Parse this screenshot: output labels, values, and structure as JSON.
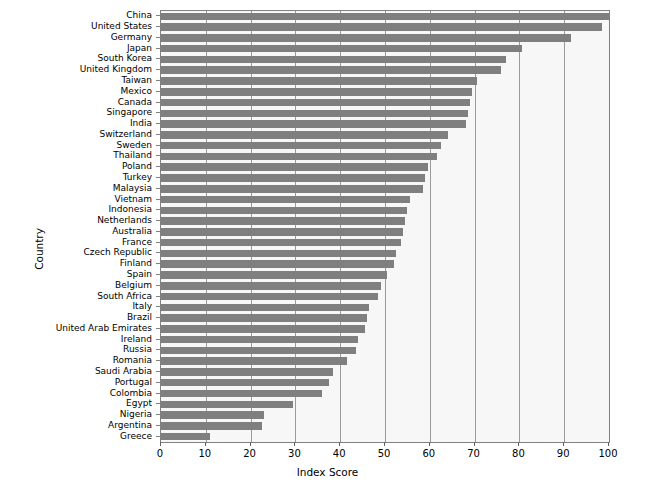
{
  "chart_data": {
    "type": "bar",
    "orientation": "horizontal",
    "title": "",
    "xlabel": "Index Score",
    "ylabel": "Country",
    "xlim": [
      0,
      100
    ],
    "xticks": [
      0,
      10,
      20,
      30,
      40,
      50,
      60,
      70,
      80,
      90,
      100
    ],
    "grid": true,
    "grid_axis": "x",
    "legend": false,
    "bar_color": "#7f7f7f",
    "plot_background": "#f7f7f7",
    "figure_background": "#ffffff",
    "categories": [
      "China",
      "United States",
      "Germany",
      "Japan",
      "South Korea",
      "United Kingdom",
      "Taiwan",
      "Mexico",
      "Canada",
      "Singapore",
      "India",
      "Switzerland",
      "Sweden",
      "Thailand",
      "Poland",
      "Turkey",
      "Malaysia",
      "Vietnam",
      "Indonesia",
      "Netherlands",
      "Australia",
      "France",
      "Czech Republic",
      "Finland",
      "Spain",
      "Belgium",
      "South Africa",
      "Italy",
      "Brazil",
      "United Arab Emirates",
      "Ireland",
      "Russia",
      "Romania",
      "Saudi Arabia",
      "Portugal",
      "Colombia",
      "Egypt",
      "Nigeria",
      "Argentina",
      "Greece"
    ],
    "values": [
      100.0,
      98.5,
      91.5,
      80.5,
      77.0,
      76.0,
      70.5,
      69.5,
      69.0,
      68.5,
      68.0,
      64.0,
      62.5,
      61.5,
      59.5,
      59.0,
      58.5,
      55.5,
      55.0,
      54.5,
      54.0,
      53.5,
      52.5,
      52.0,
      50.5,
      49.0,
      48.5,
      46.5,
      46.0,
      45.5,
      44.0,
      43.5,
      41.5,
      38.5,
      37.5,
      36.0,
      29.5,
      23.0,
      22.5,
      11.0
    ]
  }
}
